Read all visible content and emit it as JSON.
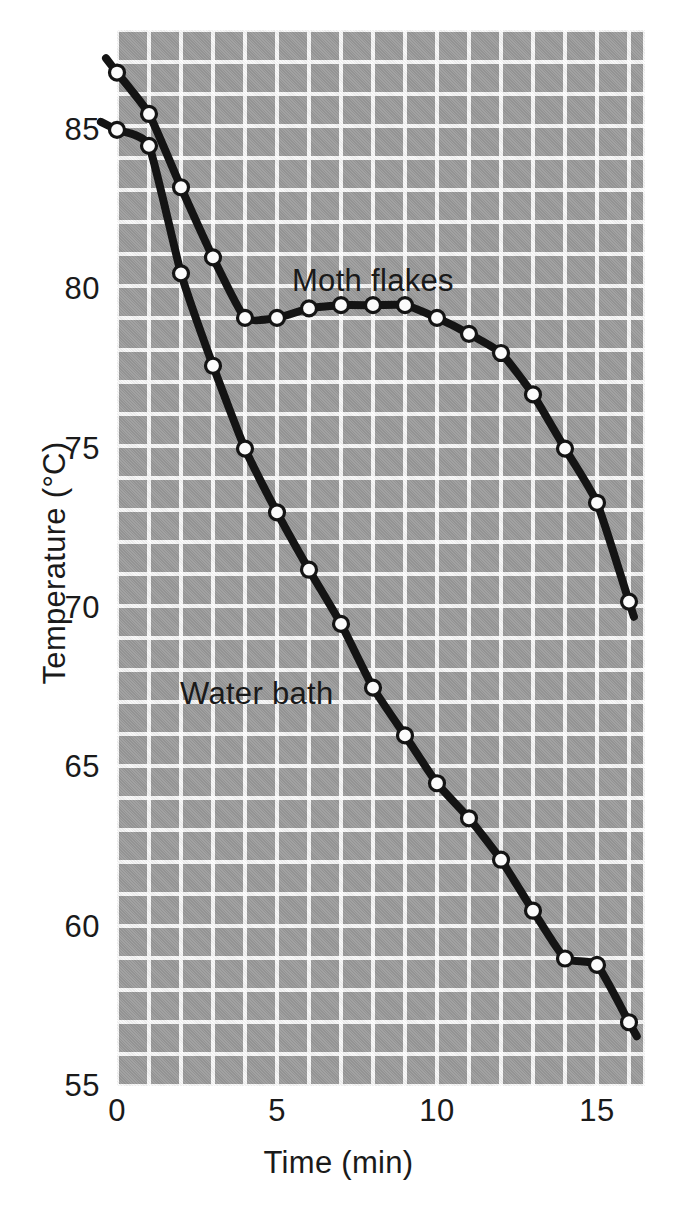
{
  "chart_data": {
    "type": "line",
    "title": "",
    "xlabel": "Time (min)",
    "ylabel": "Temperature (°C)",
    "xlim": [
      0,
      16.5
    ],
    "ylim": [
      55,
      88
    ],
    "xticks": [
      "0",
      "5",
      "10",
      "15"
    ],
    "xtick_values": [
      0,
      5,
      10,
      15
    ],
    "yticks": [
      "55",
      "60",
      "65",
      "70",
      "75",
      "80",
      "85"
    ],
    "ytick_values": [
      55,
      60,
      65,
      70,
      75,
      80,
      85
    ],
    "grid": true,
    "grid_spacing_minutes": 1,
    "grid_spacing_degrees": 1,
    "legend_position": "inline-annotation",
    "series": [
      {
        "name": "Moth flakes",
        "marker": "open-circle",
        "x": [
          0,
          1,
          2,
          3,
          4,
          5,
          6,
          7,
          8,
          9,
          10,
          11,
          12,
          13,
          14,
          15,
          16
        ],
        "values": [
          86.8,
          85.5,
          83.2,
          81.0,
          79.1,
          79.1,
          79.4,
          79.5,
          79.5,
          79.5,
          79.1,
          78.6,
          78.0,
          76.7,
          75.0,
          73.3,
          70.2
        ]
      },
      {
        "name": "Water bath",
        "marker": "open-circle",
        "x": [
          0,
          1,
          2,
          3,
          4,
          5,
          6,
          7,
          8,
          9,
          10,
          11,
          12,
          13,
          14,
          15,
          16
        ],
        "values": [
          85.0,
          84.5,
          80.5,
          77.6,
          75.0,
          73.0,
          71.2,
          69.5,
          67.5,
          66.0,
          64.5,
          63.4,
          62.1,
          60.5,
          59.0,
          58.8,
          57.0
        ]
      }
    ],
    "annotations": [
      {
        "text": "Moth flakes",
        "x": 5.5,
        "y": 80.6
      },
      {
        "text": "Water bath",
        "x": 2.0,
        "y": 68.0
      }
    ],
    "colors": {
      "panel": "#9b9b9b",
      "grid": "#ffffff",
      "line": "#141414",
      "marker_fill": "#fbfbfb",
      "text": "#1a1a1a",
      "background": "#ffffff"
    }
  }
}
